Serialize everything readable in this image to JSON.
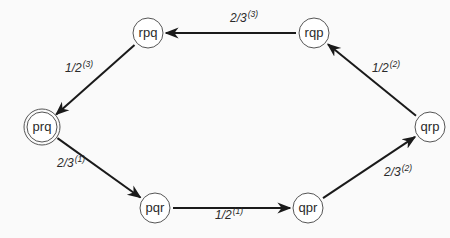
{
  "diagram": {
    "type": "state-transition-graph",
    "colors": {
      "background": "#fafafa",
      "stroke": "#1a1a1a",
      "node_stroke": "#555555",
      "text": "#2a2a2a"
    },
    "nodes": [
      {
        "id": "rpq",
        "label": "rpq",
        "x": 148,
        "y": 33,
        "double": false
      },
      {
        "id": "rqp",
        "label": "rqp",
        "x": 314,
        "y": 33,
        "double": false
      },
      {
        "id": "prq",
        "label": "prq",
        "x": 42,
        "y": 127,
        "double": true
      },
      {
        "id": "qrp",
        "label": "qrp",
        "x": 430,
        "y": 127,
        "double": false
      },
      {
        "id": "pqr",
        "label": "pqr",
        "x": 155,
        "y": 208,
        "double": false
      },
      {
        "id": "qpr",
        "label": "qpr",
        "x": 308,
        "y": 208,
        "double": false
      }
    ],
    "edges": [
      {
        "from": "prq",
        "to": "pqr",
        "label": "2/3",
        "sup": "(1)",
        "lx": 57,
        "ly": 167
      },
      {
        "from": "pqr",
        "to": "qpr",
        "label": "1/2",
        "sup": "(1)",
        "lx": 215,
        "ly": 219
      },
      {
        "from": "qpr",
        "to": "qrp",
        "label": "2/3",
        "sup": "(2)",
        "lx": 384,
        "ly": 176
      },
      {
        "from": "qrp",
        "to": "rqp",
        "label": "1/2",
        "sup": "(2)",
        "lx": 372,
        "ly": 72
      },
      {
        "from": "rqp",
        "to": "rpq",
        "label": "2/3",
        "sup": "(3)",
        "lx": 230,
        "ly": 22
      },
      {
        "from": "rpq",
        "to": "prq",
        "label": "1/2",
        "sup": "(3)",
        "lx": 65,
        "ly": 72
      }
    ]
  }
}
